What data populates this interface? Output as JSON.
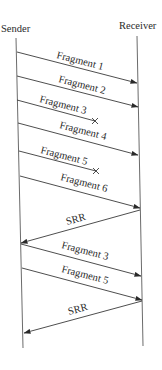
{
  "diagram": {
    "type": "sequence",
    "participants": {
      "sender": {
        "label": "Sender"
      },
      "receiver": {
        "label": "Receiver"
      }
    },
    "colors": {
      "line": "#3a3a3a",
      "text": "#2a2a2a",
      "background": "#ffffff"
    },
    "messages": [
      {
        "label": "Fragment 1",
        "from": "sender",
        "to": "receiver",
        "lost": false
      },
      {
        "label": "Fragment 2",
        "from": "sender",
        "to": "receiver",
        "lost": false
      },
      {
        "label": "Fragment 3",
        "from": "sender",
        "to": "receiver",
        "lost": true
      },
      {
        "label": "Fragment 4",
        "from": "sender",
        "to": "receiver",
        "lost": false
      },
      {
        "label": "Fragment 5",
        "from": "sender",
        "to": "receiver",
        "lost": true
      },
      {
        "label": "Fragment 6",
        "from": "sender",
        "to": "receiver",
        "lost": false
      },
      {
        "label": "SRR",
        "from": "receiver",
        "to": "sender",
        "lost": false
      },
      {
        "label": "Fragment 3",
        "from": "sender",
        "to": "receiver",
        "lost": false
      },
      {
        "label": "Fragment 5",
        "from": "sender",
        "to": "receiver",
        "lost": false
      },
      {
        "label": "SRR",
        "from": "receiver",
        "to": "sender",
        "lost": false
      }
    ]
  }
}
